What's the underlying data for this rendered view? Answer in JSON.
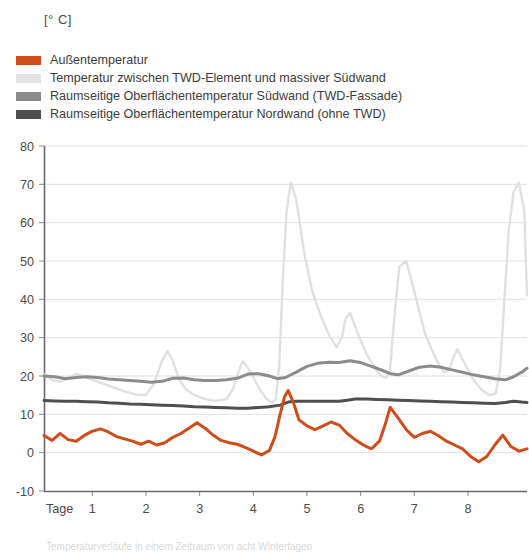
{
  "unit_label": "[° C]",
  "legend": {
    "items": [
      {
        "label": "Außentemperatur",
        "color": "#cf4d1b"
      },
      {
        "label": "Temperatur zwischen TWD-Element und massiver Südwand",
        "color": "#e3e3e3"
      },
      {
        "label": "Raumseitige Oberflächentemperatur Südwand (TWD-Fassade)",
        "color": "#8c8c8c"
      },
      {
        "label": "Raumseitige Oberflächentemperatur Nordwand (ohne TWD)",
        "color": "#4f4f4f"
      }
    ]
  },
  "caption": "Temperaturverläufe in einem Zeitraum von acht Wintertagen",
  "chart_data": {
    "type": "line",
    "title": "",
    "xlabel": "Tage",
    "ylabel": "[° C]",
    "xlim": [
      0.1,
      9.1
    ],
    "ylim": [
      -10,
      80
    ],
    "yticks": [
      80,
      70,
      60,
      50,
      40,
      30,
      20,
      10,
      0,
      -10
    ],
    "xticks": [
      1,
      2,
      3,
      4,
      5,
      6,
      7,
      8
    ],
    "xtick_labels": [
      "1",
      "2",
      "3",
      "4",
      "5",
      "6",
      "7",
      "8"
    ],
    "grid": true,
    "grid_axis": "y",
    "legend_position": "above-plot",
    "series": [
      {
        "name": "Außentemperatur",
        "color": "#cf4d1b",
        "x": [
          0.1,
          0.25,
          0.4,
          0.55,
          0.7,
          0.85,
          1.0,
          1.15,
          1.3,
          1.45,
          1.6,
          1.75,
          1.9,
          2.05,
          2.2,
          2.35,
          2.5,
          2.65,
          2.8,
          2.95,
          3.1,
          3.25,
          3.4,
          3.55,
          3.7,
          3.85,
          4.0,
          4.15,
          4.3,
          4.4,
          4.5,
          4.58,
          4.65,
          4.75,
          4.85,
          5.0,
          5.15,
          5.3,
          5.45,
          5.6,
          5.75,
          5.9,
          6.05,
          6.2,
          6.35,
          6.45,
          6.55,
          6.7,
          6.85,
          7.0,
          7.15,
          7.3,
          7.45,
          7.6,
          7.75,
          7.9,
          8.05,
          8.2,
          8.35,
          8.5,
          8.65,
          8.8,
          8.95,
          9.1
        ],
        "y": [
          4.5,
          3.2,
          5.0,
          3.4,
          3.0,
          4.5,
          5.6,
          6.2,
          5.4,
          4.2,
          3.6,
          3.0,
          2.2,
          3.0,
          2.0,
          2.6,
          4.0,
          5.0,
          6.4,
          7.8,
          6.4,
          4.6,
          3.2,
          2.6,
          2.2,
          1.4,
          0.4,
          -0.6,
          0.6,
          4.0,
          10.0,
          14.5,
          16.2,
          13.0,
          8.6,
          7.0,
          6.0,
          7.0,
          8.0,
          7.2,
          5.0,
          3.4,
          2.0,
          1.0,
          3.0,
          7.0,
          11.8,
          9.0,
          6.0,
          4.0,
          5.0,
          5.6,
          4.4,
          3.0,
          2.0,
          1.0,
          -1.0,
          -2.4,
          -1.0,
          2.0,
          4.6,
          1.6,
          0.4,
          1.0
        ]
      },
      {
        "name": "Temperatur zwischen TWD-Element und massiver Südwand",
        "color": "#e0e0e0",
        "x": [
          0.1,
          0.25,
          0.4,
          0.55,
          0.7,
          0.85,
          1.0,
          1.2,
          1.4,
          1.6,
          1.8,
          2.0,
          2.15,
          2.3,
          2.4,
          2.5,
          2.62,
          2.75,
          2.9,
          3.1,
          3.3,
          3.5,
          3.62,
          3.7,
          3.8,
          3.95,
          4.1,
          4.25,
          4.35,
          4.42,
          4.48,
          4.55,
          4.62,
          4.7,
          4.8,
          4.95,
          5.1,
          5.25,
          5.4,
          5.55,
          5.65,
          5.72,
          5.8,
          5.95,
          6.1,
          6.25,
          6.38,
          6.48,
          6.55,
          6.62,
          6.72,
          6.85,
          7.0,
          7.2,
          7.4,
          7.55,
          7.65,
          7.72,
          7.8,
          7.95,
          8.1,
          8.25,
          8.4,
          8.52,
          8.6,
          8.68,
          8.76,
          8.85,
          8.95,
          9.05,
          9.1
        ],
        "y": [
          20.5,
          19.0,
          18.5,
          19.5,
          20.5,
          20.0,
          19.0,
          18.0,
          17.0,
          16.0,
          15.2,
          15.0,
          18.0,
          24.0,
          26.5,
          24.0,
          19.0,
          16.5,
          15.0,
          14.0,
          13.5,
          14.0,
          16.5,
          20.0,
          24.0,
          21.0,
          17.0,
          14.0,
          13.0,
          14.0,
          22.0,
          45.0,
          63.0,
          70.5,
          66.0,
          52.0,
          42.0,
          36.0,
          31.0,
          27.5,
          30.0,
          35.0,
          36.5,
          31.0,
          26.0,
          22.5,
          20.0,
          19.5,
          22.0,
          34.0,
          48.5,
          50.0,
          42.0,
          31.0,
          24.5,
          21.0,
          21.5,
          24.5,
          27.0,
          23.0,
          19.0,
          16.5,
          15.0,
          15.5,
          22.0,
          40.0,
          58.0,
          68.0,
          70.5,
          63.0,
          41.0
        ]
      },
      {
        "name": "Raumseitige Oberflächentemperatur Südwand (TWD-Fassade)",
        "color": "#8c8c8c",
        "x": [
          0.1,
          0.3,
          0.5,
          0.7,
          0.9,
          1.1,
          1.3,
          1.5,
          1.7,
          1.9,
          2.1,
          2.3,
          2.5,
          2.7,
          2.9,
          3.1,
          3.3,
          3.5,
          3.7,
          3.9,
          4.1,
          4.3,
          4.45,
          4.6,
          4.8,
          5.0,
          5.2,
          5.4,
          5.6,
          5.8,
          6.0,
          6.2,
          6.4,
          6.55,
          6.7,
          6.9,
          7.1,
          7.3,
          7.5,
          7.7,
          7.9,
          8.1,
          8.3,
          8.5,
          8.7,
          8.85,
          9.0,
          9.1
        ],
        "y": [
          20.0,
          19.8,
          19.3,
          19.6,
          19.8,
          19.6,
          19.2,
          19.0,
          18.8,
          18.6,
          18.4,
          18.6,
          19.4,
          19.5,
          19.0,
          18.8,
          18.8,
          19.0,
          19.4,
          20.5,
          20.6,
          20.0,
          19.3,
          19.6,
          21.0,
          22.5,
          23.3,
          23.6,
          23.5,
          24.0,
          23.5,
          22.5,
          21.5,
          20.6,
          20.3,
          21.3,
          22.3,
          22.6,
          22.3,
          21.6,
          21.0,
          20.3,
          19.8,
          19.3,
          19.0,
          19.8,
          21.0,
          22.0
        ]
      },
      {
        "name": "Raumseitige Oberflächentemperatur Nordwand (ohne TWD)",
        "color": "#4f4f4f",
        "x": [
          0.1,
          0.3,
          0.5,
          0.7,
          0.9,
          1.1,
          1.3,
          1.5,
          1.7,
          1.9,
          2.1,
          2.3,
          2.5,
          2.7,
          2.9,
          3.1,
          3.3,
          3.5,
          3.7,
          3.9,
          4.1,
          4.3,
          4.5,
          4.65,
          4.8,
          5.0,
          5.2,
          5.4,
          5.6,
          5.75,
          5.9,
          6.1,
          6.3,
          6.5,
          6.7,
          6.9,
          7.1,
          7.3,
          7.5,
          7.7,
          7.9,
          8.1,
          8.3,
          8.5,
          8.7,
          8.85,
          9.0,
          9.1
        ],
        "y": [
          13.6,
          13.5,
          13.4,
          13.4,
          13.3,
          13.2,
          13.0,
          12.9,
          12.7,
          12.6,
          12.5,
          12.4,
          12.3,
          12.2,
          12.0,
          11.9,
          11.8,
          11.7,
          11.6,
          11.6,
          11.8,
          12.0,
          12.4,
          13.2,
          13.4,
          13.4,
          13.4,
          13.4,
          13.4,
          13.7,
          14.0,
          14.0,
          13.9,
          13.8,
          13.7,
          13.6,
          13.5,
          13.4,
          13.3,
          13.2,
          13.1,
          13.0,
          12.9,
          12.8,
          13.1,
          13.4,
          13.2,
          13.1
        ]
      }
    ]
  }
}
